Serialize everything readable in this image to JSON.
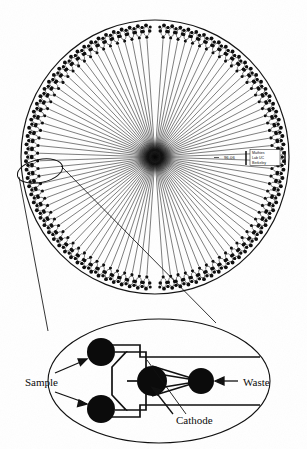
{
  "figure": {
    "kind": "radial-microfluidic-wafer-diagram",
    "background_color": "#ffffff",
    "ink_color": "#111111"
  },
  "wafer": {
    "name": "radial capillary array electrophoresis wafer",
    "center_x": 155,
    "center_y": 157,
    "radius_x": 134,
    "radius_y": 137,
    "lane_count": 96,
    "gap_degrees": 8,
    "hub_label": "central detection hub",
    "spoke_inner_radius": 6,
    "spoke_outer_radius": 118,
    "unit_cell_wells_per_lane": 4
  },
  "scale_annotation": {
    "text": "96-06",
    "x": 224,
    "y": 158
  },
  "watermark": {
    "line1": "Mathies",
    "line2": "Lab UC",
    "line3": "Berkeley",
    "x": 257,
    "y": 150,
    "width": 26,
    "height": 17
  },
  "callout": {
    "name": "unit-cell-callout",
    "highlight_ellipse": {
      "cx": 40,
      "cy": 171,
      "rx": 22,
      "ry": 11,
      "rotation": -12
    },
    "leader_line_1": {
      "x1": 19,
      "y1": 178,
      "x2": 48,
      "y2": 330
    },
    "leader_line_2": {
      "x1": 60,
      "y1": 166,
      "x2": 215,
      "y2": 322
    }
  },
  "inset": {
    "name": "unit-cell-detail",
    "ellipse": {
      "cx": 159,
      "cy": 381,
      "rx": 111,
      "ry": 62
    },
    "wells": [
      {
        "name": "sample-well-top",
        "cx": 101,
        "cy": 352,
        "r": 14
      },
      {
        "name": "sample-well-bottom",
        "cx": 101,
        "cy": 409,
        "r": 14
      },
      {
        "name": "cathode-well",
        "cx": 152,
        "cy": 381,
        "r": 15
      },
      {
        "name": "waste-well",
        "cx": 201,
        "cy": 381,
        "r": 13
      }
    ],
    "labels": {
      "sample": "Sample",
      "waste": "Waste",
      "cathode": "Cathode"
    },
    "label_positions": {
      "sample": {
        "x": 25,
        "y": 385
      },
      "waste": {
        "x": 224,
        "y": 385
      },
      "cathode": {
        "x": 150,
        "y": 423
      }
    }
  }
}
